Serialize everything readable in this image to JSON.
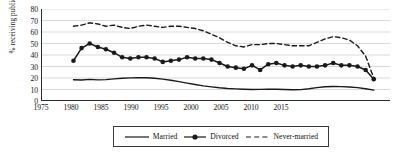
{
  "chart_data": {
    "type": "line",
    "title": "",
    "xlabel": "",
    "ylabel": "% receiving public aid",
    "xlim": [
      1975,
      2018
    ],
    "ylim": [
      0,
      80
    ],
    "ytick_step": 10,
    "xtick_step": 5,
    "grid": true,
    "gridlines": "horizontal",
    "legend_position": "bottom",
    "yticks": [
      "80",
      "70",
      "60",
      "50",
      "40",
      "30",
      "20",
      "10",
      "0"
    ],
    "xticks": [
      "1975",
      "1980",
      "1985",
      "1990",
      "1995",
      "2000",
      "2005",
      "2010",
      "2015"
    ],
    "series": [
      {
        "name": "Married",
        "style": "solid",
        "markers": false,
        "color": "#1a1a1a",
        "x": [
          1979,
          1980,
          1981,
          1982,
          1983,
          1984,
          1985,
          1986,
          1987,
          1988,
          1989,
          1990,
          1991,
          1992,
          1993,
          1994,
          1995,
          1996,
          1997,
          1998,
          1999,
          2000,
          2001,
          2002,
          2003,
          2004,
          2005,
          2006,
          2007,
          2008,
          2009,
          2010,
          2011,
          2012,
          2013,
          2014,
          2015,
          2016
        ],
        "values": [
          18.5,
          18.3,
          18.8,
          18.4,
          18.6,
          19.2,
          19.8,
          20.1,
          20.3,
          20.2,
          19.8,
          19.0,
          18.0,
          16.8,
          15.5,
          14.3,
          13.2,
          12.3,
          11.5,
          10.9,
          10.5,
          10.2,
          10.0,
          10.1,
          10.2,
          10.2,
          10.0,
          9.8,
          9.9,
          10.6,
          11.6,
          12.4,
          12.6,
          12.5,
          12.2,
          11.6,
          10.6,
          9.5
        ]
      },
      {
        "name": "Divorced",
        "style": "solid",
        "markers": true,
        "color": "#1a1a1a",
        "x": [
          1979,
          1980,
          1981,
          1982,
          1983,
          1984,
          1985,
          1986,
          1987,
          1988,
          1989,
          1990,
          1991,
          1992,
          1993,
          1994,
          1995,
          1996,
          1997,
          1998,
          1999,
          2000,
          2001,
          2002,
          2003,
          2004,
          2005,
          2006,
          2007,
          2008,
          2009,
          2010,
          2011,
          2012,
          2013,
          2014,
          2015,
          2016
        ],
        "values": [
          35,
          46,
          50,
          47,
          45,
          42,
          38,
          37,
          38,
          38,
          37,
          34,
          35,
          36,
          38,
          37,
          37,
          36,
          33,
          30,
          29,
          28,
          31,
          27,
          32,
          33,
          31,
          30,
          31,
          30,
          30,
          31,
          33,
          31,
          31,
          30,
          27,
          19
        ]
      },
      {
        "name": "Never-married",
        "style": "dashed",
        "markers": false,
        "color": "#1a1a1a",
        "x": [
          1979,
          1980,
          1981,
          1982,
          1983,
          1984,
          1985,
          1986,
          1987,
          1988,
          1989,
          1990,
          1991,
          1992,
          1993,
          1994,
          1995,
          1996,
          1997,
          1998,
          1999,
          2000,
          2001,
          2002,
          2003,
          2004,
          2005,
          2006,
          2007,
          2008,
          2009,
          2010,
          2011,
          2012,
          2013,
          2014,
          2015,
          2016
        ],
        "values": [
          65,
          66,
          68,
          67,
          65,
          66,
          64,
          63,
          65,
          66,
          65,
          64,
          65,
          65,
          64,
          63,
          61,
          58,
          55,
          51,
          48,
          47,
          49,
          49,
          50,
          50,
          49,
          48,
          48,
          48,
          51,
          54,
          56,
          55,
          53,
          48,
          39,
          20
        ]
      }
    ]
  },
  "legend": {
    "items": [
      {
        "label": "Married",
        "style": "solid",
        "marker": false
      },
      {
        "label": "Divorced",
        "style": "solid",
        "marker": true
      },
      {
        "label": "Never-married",
        "style": "dashed",
        "marker": false
      }
    ]
  }
}
